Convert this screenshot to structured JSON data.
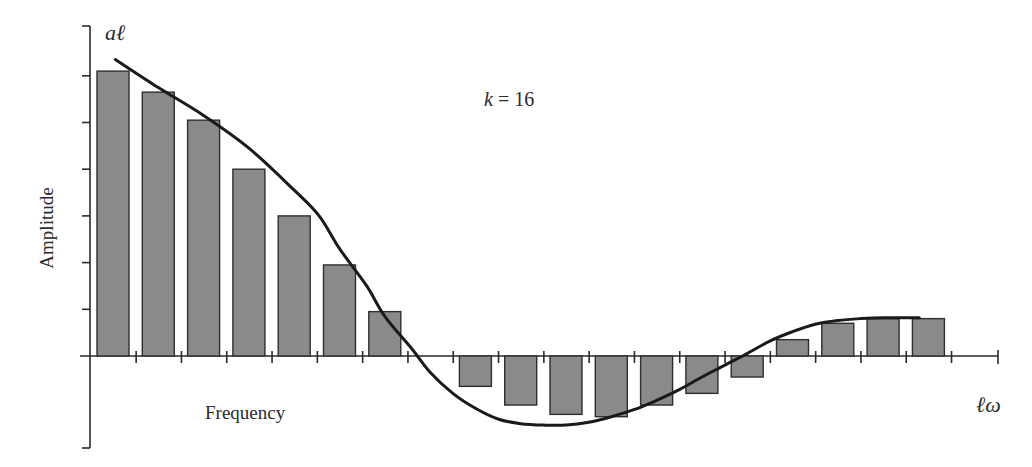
{
  "chart_data": {
    "type": "bar",
    "title": "",
    "xlabel": "Frequency",
    "ylabel": "Amplitude",
    "y_axis_variable": "aℓ",
    "x_axis_variable": "ℓω",
    "annotation": "k = 16",
    "annotation_parts": {
      "var": "k",
      "rest": " = 16"
    },
    "categories": [
      "1",
      "2",
      "3",
      "4",
      "5",
      "6",
      "7",
      "8",
      "9",
      "10",
      "11",
      "12",
      "13",
      "14",
      "15",
      "16",
      "17",
      "18",
      "19"
    ],
    "values": [
      6.1,
      5.65,
      5.05,
      4.0,
      3.0,
      1.95,
      0.95,
      0,
      -0.65,
      -1.05,
      -1.25,
      -1.3,
      -1.05,
      -0.8,
      -0.45,
      0.35,
      0.7,
      0.8,
      0.8
    ],
    "series": [
      {
        "name": "Amplitude bars aℓ",
        "type": "bar",
        "values": [
          6.1,
          5.65,
          5.05,
          4.0,
          3.0,
          1.95,
          0.95,
          0,
          -0.65,
          -1.05,
          -1.25,
          -1.3,
          -1.05,
          -0.8,
          -0.45,
          0.35,
          0.7,
          0.8,
          0.8
        ]
      },
      {
        "name": "Continuous envelope",
        "type": "line",
        "points": [
          [
            0.55,
            6.35
          ],
          [
            1.5,
            5.75
          ],
          [
            2.5,
            5.15
          ],
          [
            3.5,
            4.45
          ],
          [
            4.5,
            3.55
          ],
          [
            5.05,
            3.0
          ],
          [
            5.5,
            2.3
          ],
          [
            6.1,
            1.5
          ],
          [
            6.5,
            0.85
          ],
          [
            7.1,
            0.15
          ],
          [
            7.5,
            -0.35
          ],
          [
            8.0,
            -0.8
          ],
          [
            8.5,
            -1.12
          ],
          [
            9.0,
            -1.35
          ],
          [
            9.5,
            -1.45
          ],
          [
            10.0,
            -1.48
          ],
          [
            10.5,
            -1.48
          ],
          [
            11.0,
            -1.42
          ],
          [
            11.5,
            -1.3
          ],
          [
            12.0,
            -1.15
          ],
          [
            12.5,
            -0.95
          ],
          [
            13.0,
            -0.72
          ],
          [
            13.5,
            -0.45
          ],
          [
            14.0,
            -0.2
          ],
          [
            14.4,
            0.0
          ],
          [
            15.0,
            0.32
          ],
          [
            15.5,
            0.52
          ],
          [
            16.0,
            0.68
          ],
          [
            16.5,
            0.76
          ],
          [
            17.0,
            0.8
          ],
          [
            17.5,
            0.82
          ],
          [
            18.3,
            0.82
          ]
        ]
      }
    ],
    "ylim": [
      -1.95,
      7.1
    ],
    "y_ticks_count_above_zero": 6,
    "grid": false,
    "legend": "none",
    "colors": {
      "bar_fill": "#8a8a8a",
      "bar_stroke": "#2e2e2e",
      "curve": "#1a1a1a",
      "axis": "#2a2a2a"
    }
  }
}
